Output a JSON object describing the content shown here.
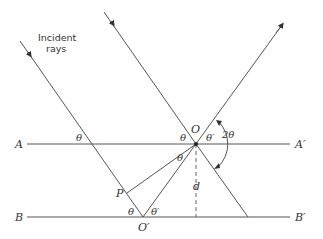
{
  "caption": {
    "line1": "Incident",
    "line2": "rays"
  },
  "planes": {
    "A": "A",
    "A_prime": "A′",
    "B": "B",
    "B_prime": "B′"
  },
  "points": {
    "O": "O",
    "O_prime": "O′",
    "P": "P"
  },
  "angles": {
    "theta_A": "θ",
    "theta_O_left": "θ",
    "theta_O_right": "θ′",
    "two_theta": "2θ",
    "theta_PO": "θ",
    "theta_Oprime_left": "θ",
    "theta_Oprime_right": "θ′"
  },
  "spacing": {
    "d": "d"
  },
  "colors": {
    "line": "#555555",
    "text": "#333333"
  }
}
